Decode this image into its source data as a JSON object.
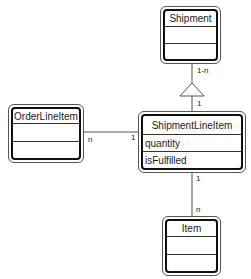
{
  "diagram": {
    "type": "UML class diagram",
    "classes": {
      "shipment": {
        "name": "Shipment",
        "attributes": []
      },
      "order_line_item": {
        "name": "OrderLineItem",
        "attributes": []
      },
      "shipment_line_item": {
        "name": "ShipmentLineItem",
        "attributes": [
          "quantity",
          "isFulfilled"
        ]
      },
      "item": {
        "name": "Item",
        "attributes": []
      }
    },
    "associations": [
      {
        "from": "Shipment",
        "to": "ShipmentLineItem",
        "kind": "aggregation",
        "from_mult": "1-n",
        "to_mult": "1"
      },
      {
        "from": "OrderLineItem",
        "to": "ShipmentLineItem",
        "kind": "association",
        "from_mult": "n",
        "to_mult": "1"
      },
      {
        "from": "ShipmentLineItem",
        "to": "Item",
        "kind": "association",
        "from_mult": "1",
        "to_mult": "n"
      }
    ],
    "labels": {
      "ship_to_sli_top": "1-n",
      "ship_to_sli_bottom": "1",
      "oli_left": "n",
      "oli_right": "1",
      "sli_to_item_top": "1",
      "sli_to_item_bottom": "n"
    },
    "colors": {
      "line": "#555555",
      "box_border": "#111111",
      "background": "#ffffff"
    }
  }
}
